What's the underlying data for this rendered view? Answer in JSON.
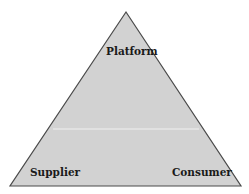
{
  "diagram": {
    "shape": "triangle",
    "colors": {
      "fill": "#d2d2d2",
      "stroke": "#4a4a4a",
      "divider": "#f0f0f0"
    },
    "nodes": {
      "top": "Platform",
      "bottom_left": "Supplier",
      "bottom_right": "Consumer"
    }
  }
}
